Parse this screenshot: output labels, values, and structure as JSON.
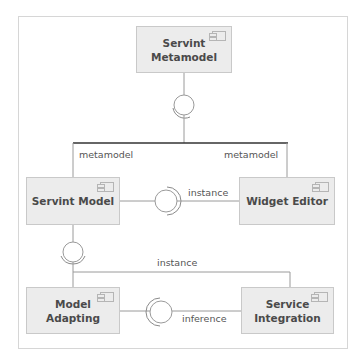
{
  "diagram": {
    "type": "UML component diagram",
    "components": {
      "servint_metamodel": {
        "label_line1": "Servint",
        "label_line2": "Metamodel"
      },
      "servint_model": {
        "label": "Servint Model"
      },
      "widget_editor": {
        "label": "Widget Editor"
      },
      "model_adapting": {
        "label": "Model Adapting"
      },
      "service_integration": {
        "label_line1": "Service",
        "label_line2": "Integration"
      }
    },
    "connectors": {
      "metamodel_left": "metamodel",
      "metamodel_right": "metamodel",
      "instance_middle": "instance",
      "instance_bottom": "instance",
      "inference": "inference"
    },
    "icons": {
      "component": "uml-component-icon",
      "interface": "lollipop-interface-icon"
    },
    "colors": {
      "component_fill": "#ececec",
      "component_border": "#c9c9c9",
      "connector": "#9a9a9a",
      "text": "#4a4a4a"
    }
  }
}
